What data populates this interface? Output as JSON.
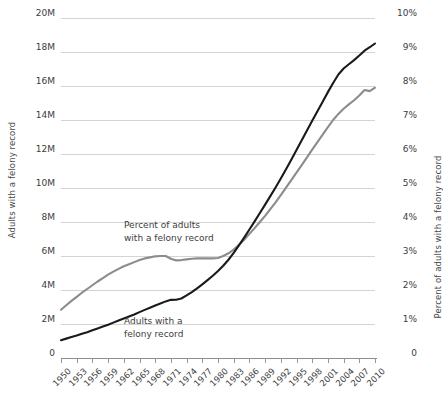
{
  "chart_data": {
    "type": "line",
    "title": "",
    "subtitle": "",
    "xlabel": "",
    "grid": true,
    "legend_position": "inline-annotations",
    "x": [
      1950,
      1951,
      1952,
      1953,
      1954,
      1955,
      1956,
      1957,
      1958,
      1959,
      1960,
      1961,
      1962,
      1963,
      1964,
      1965,
      1966,
      1967,
      1968,
      1969,
      1970,
      1971,
      1972,
      1973,
      1974,
      1975,
      1976,
      1977,
      1978,
      1979,
      1980,
      1981,
      1982,
      1983,
      1984,
      1985,
      1986,
      1987,
      1988,
      1989,
      1990,
      1991,
      1992,
      1993,
      1994,
      1995,
      1996,
      1997,
      1998,
      1999,
      2000,
      2001,
      2002,
      2003,
      2004,
      2005,
      2006,
      2007,
      2008,
      2009,
      2010
    ],
    "xlim": [
      1950,
      2010
    ],
    "xtick_labels": [
      "1950",
      "1953",
      "1956",
      "1959",
      "1962",
      "1965",
      "1968",
      "1971",
      "1974",
      "1977",
      "1980",
      "1983",
      "1986",
      "1989",
      "1992",
      "1995",
      "1998",
      "2001",
      "2004",
      "2007",
      "2010"
    ],
    "axes": [
      {
        "id": "left",
        "label": "Adults with a felony record",
        "ylim": [
          0,
          20000000
        ],
        "tick_labels": [
          "0",
          "2M",
          "4M",
          "6M",
          "8M",
          "10M",
          "12M",
          "14M",
          "16M",
          "18M",
          "20M"
        ],
        "tick_values": [
          0,
          2000000,
          4000000,
          6000000,
          8000000,
          10000000,
          12000000,
          14000000,
          16000000,
          18000000,
          20000000
        ]
      },
      {
        "id": "right",
        "label": "Percent of adults with a felony record",
        "ylim": [
          0,
          10
        ],
        "tick_labels": [
          "0",
          "1%",
          "2%",
          "3%",
          "4%",
          "5%",
          "6%",
          "7%",
          "8%",
          "9%",
          "10%"
        ],
        "tick_values": [
          0,
          1,
          2,
          3,
          4,
          5,
          6,
          7,
          8,
          9,
          10
        ]
      }
    ],
    "series": [
      {
        "name": "Adults with a felony record",
        "axis": "left",
        "color": "#1a1a1a",
        "unit": "people",
        "values": [
          1050000,
          1140000,
          1230000,
          1320000,
          1420000,
          1520000,
          1630000,
          1740000,
          1850000,
          1960000,
          2080000,
          2200000,
          2320000,
          2440000,
          2560000,
          2700000,
          2830000,
          2960000,
          3090000,
          3210000,
          3330000,
          3420000,
          3430000,
          3500000,
          3680000,
          3880000,
          4100000,
          4330000,
          4580000,
          4840000,
          5120000,
          5430000,
          5780000,
          6180000,
          6620000,
          7080000,
          7560000,
          8040000,
          8530000,
          9020000,
          9520000,
          10030000,
          10560000,
          11100000,
          11660000,
          12230000,
          12810000,
          13380000,
          13950000,
          14520000,
          15080000,
          15640000,
          16180000,
          16680000,
          17030000,
          17280000,
          17520000,
          17790000,
          18080000,
          18280000,
          18500000
        ]
      },
      {
        "name": "Percent of adults with a felony record",
        "axis": "right",
        "color": "#8c8c8c",
        "unit": "percent",
        "values": [
          1.42,
          1.55,
          1.68,
          1.8,
          1.92,
          2.03,
          2.14,
          2.25,
          2.35,
          2.45,
          2.54,
          2.62,
          2.7,
          2.76,
          2.82,
          2.88,
          2.93,
          2.96,
          2.99,
          3.0,
          3.0,
          2.92,
          2.87,
          2.88,
          2.9,
          2.92,
          2.93,
          2.93,
          2.93,
          2.93,
          2.94,
          3.0,
          3.08,
          3.19,
          3.33,
          3.48,
          3.65,
          3.82,
          4.0,
          4.18,
          4.38,
          4.58,
          4.79,
          5.01,
          5.23,
          5.45,
          5.67,
          5.9,
          6.13,
          6.35,
          6.57,
          6.79,
          7.0,
          7.18,
          7.33,
          7.46,
          7.58,
          7.72,
          7.88,
          7.85,
          7.95
        ]
      }
    ],
    "annotations": [
      {
        "id": "percent-annotation",
        "lines": [
          "Percent of adults",
          "with a felony record"
        ]
      },
      {
        "id": "count-annotation",
        "lines": [
          "Adults with a",
          "felony record"
        ]
      }
    ]
  }
}
